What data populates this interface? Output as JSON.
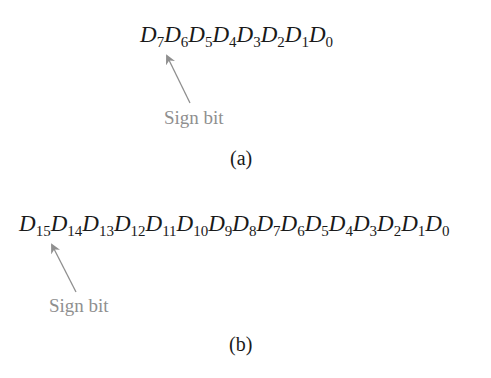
{
  "part_a": {
    "bit_prefix": "D",
    "bits": [
      "7",
      "6",
      "5",
      "4",
      "3",
      "2",
      "1",
      "0"
    ],
    "annotation": "Sign bit",
    "caption": "(a)"
  },
  "part_b": {
    "bit_prefix": "D",
    "bits": [
      "15",
      "14",
      "13",
      "12",
      "11",
      "10",
      "9",
      "8",
      "7",
      "6",
      "5",
      "4",
      "3",
      "2",
      "1",
      "0"
    ],
    "annotation": "Sign bit",
    "caption": "(b)"
  },
  "colors": {
    "text": "#1a1a1a",
    "annotation": "#8f8f8f"
  }
}
